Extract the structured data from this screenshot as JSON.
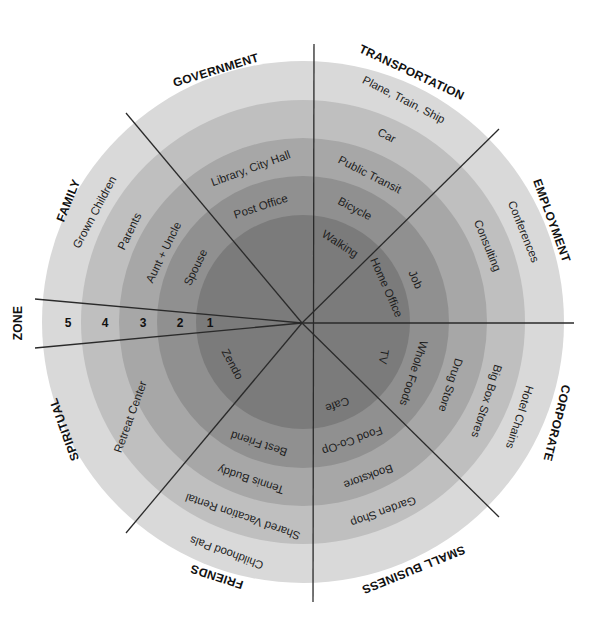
{
  "colors": {
    "zone1": "#7b7b7b",
    "zone2": "#909090",
    "zone3": "#a7a7a7",
    "zone4": "#bfbfbf",
    "zone5": "#d9d9d9",
    "divider": "#2a2a2a",
    "background": "#ffffff"
  },
  "zone_axis": {
    "label": "ZONE",
    "numbers": [
      "5",
      "4",
      "3",
      "2",
      "1"
    ]
  },
  "categories": {
    "government": "GOVERNMENT",
    "transportation": "TRANSPORTATION",
    "employment": "EMPLOYMENT",
    "corporate": "CORPORATE",
    "small_business": "SMALL BUSINESS",
    "friends": "FRIENDS",
    "spiritual": "SPIRITUAL",
    "family": "FAMILY"
  },
  "sectors": {
    "government": {
      "zone3": "Library, City Hall",
      "zone2": "Post Office"
    },
    "family": {
      "zone5": "Grown Children",
      "zone4": "Parents",
      "zone3": "Aunt + Uncle",
      "zone2": "Spouse"
    },
    "transportation": {
      "zone5": "Plane, Train, Ship",
      "zone4": "Car",
      "zone3": "Public Transit",
      "zone2": "Bicycle",
      "zone1": "Walking"
    },
    "employment": {
      "zone1": "Home Office",
      "zone2": "Job",
      "zone4": "Consulting",
      "zone5": "Conferences"
    },
    "corporate": {
      "zone1": "TV",
      "zone2": "Whole Foods",
      "zone3": "Drug Store",
      "zone4": "Big Box Stores",
      "zone5": "Hotel Chains"
    },
    "small_business": {
      "zone1": "Cafe",
      "zone2": "Food Co-Op",
      "zone3": "Bookstore",
      "zone4": "Garden Shop"
    },
    "spiritual": {
      "zone1": "Zendo",
      "zone4": "Retreat Center"
    },
    "friends": {
      "zone2": "Best Friend",
      "zone3": "Tennis Buddy",
      "zone4": "Shared Vacation Rental",
      "zone5": "Childhood Pals"
    }
  }
}
